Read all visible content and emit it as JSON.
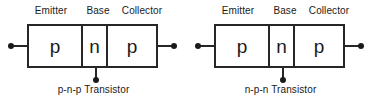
{
  "figure": {
    "background_color": "#ffffff",
    "line_color": "#262626",
    "text_color": "#1a1a1a"
  },
  "transistors": [
    {
      "id": "pnp",
      "caption": "p-n-p Transistor",
      "segments": [
        {
          "label": "Emitter",
          "letter": "p"
        },
        {
          "label": "Base",
          "letter": "n"
        },
        {
          "label": "Collector",
          "letter": "p"
        }
      ],
      "terminals": {
        "left": "emitter-terminal",
        "right": "collector-terminal",
        "bottom": "base-terminal"
      }
    },
    {
      "id": "npn",
      "caption": "n-p-n Transistor",
      "segments": [
        {
          "label": "Emitter",
          "letter": "p"
        },
        {
          "label": "Base",
          "letter": "n"
        },
        {
          "label": "Collector",
          "letter": "p"
        }
      ],
      "terminals": {
        "left": "emitter-terminal",
        "right": "collector-terminal",
        "bottom": "base-terminal"
      }
    }
  ]
}
